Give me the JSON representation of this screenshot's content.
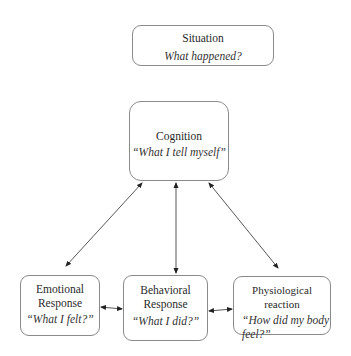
{
  "diagram": {
    "nodes": {
      "situation": {
        "title": "Situation",
        "subtitle": "What happened?"
      },
      "cognition": {
        "title": "Cognition",
        "subtitle": "“What I tell myself”"
      },
      "emotional": {
        "title_line1": "Emotional",
        "title_line2": "Response",
        "subtitle": "“What I felt?”"
      },
      "behavioral": {
        "title_line1": "Behavioral",
        "title_line2": "Response",
        "subtitle": "“What I did?”"
      },
      "physiological": {
        "title": "Physiological reaction",
        "subtitle_line1": "“How did my body",
        "subtitle_line2": "feel?”"
      }
    },
    "edges": [
      {
        "from": "cognition",
        "to": "emotional",
        "type": "bidirectional"
      },
      {
        "from": "cognition",
        "to": "behavioral",
        "type": "bidirectional"
      },
      {
        "from": "cognition",
        "to": "physiological",
        "type": "bidirectional"
      },
      {
        "from": "emotional",
        "to": "behavioral",
        "type": "bidirectional"
      },
      {
        "from": "behavioral",
        "to": "physiological",
        "type": "bidirectional"
      }
    ],
    "colors": {
      "box_border": "#8a8a8a",
      "arrow": "#333333",
      "text": "#222222"
    }
  }
}
